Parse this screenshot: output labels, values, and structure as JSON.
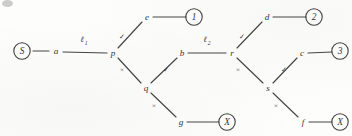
{
  "figure": {
    "stroke_color": "#2b2b2b",
    "background_color": "#fdfdfc"
  },
  "nodes": [
    {
      "id": "S",
      "label": "S",
      "x": 22,
      "y": 51,
      "shape": "circled",
      "name": "node-s"
    },
    {
      "id": "a",
      "label": "a",
      "x": 56,
      "y": 51,
      "shape": "plain",
      "name": "node-a"
    },
    {
      "id": "p",
      "label": "p",
      "x": 113,
      "y": 53,
      "shape": "plain",
      "name": "node-p"
    },
    {
      "id": "e",
      "label": "e",
      "x": 147,
      "y": 17,
      "shape": "plain",
      "name": "node-e"
    },
    {
      "id": "q",
      "label": "q",
      "x": 146,
      "y": 88,
      "shape": "plain",
      "name": "node-q"
    },
    {
      "id": "g",
      "label": "g",
      "x": 181,
      "y": 122,
      "shape": "plain",
      "name": "node-g"
    },
    {
      "id": "b",
      "label": "b",
      "x": 182,
      "y": 53,
      "shape": "plain",
      "name": "node-b"
    },
    {
      "id": "r",
      "label": "r",
      "x": 232,
      "y": 53,
      "shape": "plain",
      "name": "node-r"
    },
    {
      "id": "d",
      "label": "d",
      "x": 267,
      "y": 17,
      "shape": "plain",
      "name": "node-d"
    },
    {
      "id": "s",
      "label": "s",
      "x": 268,
      "y": 88,
      "shape": "plain",
      "name": "node-s-lower"
    },
    {
      "id": "c",
      "label": "c",
      "x": 302,
      "y": 53,
      "shape": "plain",
      "name": "node-c"
    },
    {
      "id": "f",
      "label": "f",
      "x": 303,
      "y": 122,
      "shape": "plain",
      "name": "node-f"
    },
    {
      "id": "T1",
      "label": "1",
      "x": 194,
      "y": 17,
      "shape": "circled",
      "name": "terminal-1"
    },
    {
      "id": "T2",
      "label": "2",
      "x": 314,
      "y": 17,
      "shape": "circled",
      "name": "terminal-2"
    },
    {
      "id": "T3",
      "label": "3",
      "x": 340,
      "y": 51,
      "shape": "circled",
      "name": "terminal-3"
    },
    {
      "id": "X1",
      "label": "X",
      "x": 227,
      "y": 122,
      "shape": "circled",
      "name": "terminal-x-1"
    },
    {
      "id": "X2",
      "label": "X",
      "x": 340,
      "y": 122,
      "shape": "circled",
      "name": "terminal-x-2"
    }
  ],
  "edges": [
    {
      "from": "S",
      "to": "a",
      "x1": 33,
      "y1": 51,
      "x2": 49,
      "y2": 51,
      "mark": "",
      "name": "edge-s-a"
    },
    {
      "from": "a",
      "to": "p",
      "x1": 63,
      "y1": 52,
      "x2": 107,
      "y2": 53,
      "mark": "",
      "name": "edge-a-p"
    },
    {
      "from": "p",
      "to": "e",
      "x1": 118,
      "y1": 48,
      "x2": 142,
      "y2": 22,
      "mark": "check",
      "name": "edge-p-e"
    },
    {
      "from": "e",
      "to": "T1",
      "x1": 153,
      "y1": 17,
      "x2": 186,
      "y2": 17,
      "mark": "",
      "name": "edge-e-t1"
    },
    {
      "from": "p",
      "to": "q",
      "x1": 118,
      "y1": 58,
      "x2": 141,
      "y2": 83,
      "mark": "cross",
      "name": "edge-p-q"
    },
    {
      "from": "q",
      "to": "b",
      "x1": 151,
      "y1": 83,
      "x2": 177,
      "y2": 58,
      "mark": "check",
      "name": "edge-q-b"
    },
    {
      "from": "q",
      "to": "g",
      "x1": 151,
      "y1": 93,
      "x2": 176,
      "y2": 117,
      "mark": "cross",
      "name": "edge-q-g"
    },
    {
      "from": "g",
      "to": "X1",
      "x1": 187,
      "y1": 122,
      "x2": 219,
      "y2": 122,
      "mark": "",
      "name": "edge-g-x1"
    },
    {
      "from": "b",
      "to": "r",
      "x1": 188,
      "y1": 53,
      "x2": 226,
      "y2": 53,
      "mark": "",
      "name": "edge-b-r"
    },
    {
      "from": "r",
      "to": "d",
      "x1": 237,
      "y1": 48,
      "x2": 262,
      "y2": 22,
      "mark": "check",
      "name": "edge-r-d"
    },
    {
      "from": "d",
      "to": "T2",
      "x1": 273,
      "y1": 17,
      "x2": 306,
      "y2": 17,
      "mark": "",
      "name": "edge-d-t2"
    },
    {
      "from": "r",
      "to": "s",
      "x1": 237,
      "y1": 58,
      "x2": 263,
      "y2": 83,
      "mark": "cross",
      "name": "edge-r-s"
    },
    {
      "from": "s",
      "to": "c",
      "x1": 273,
      "y1": 83,
      "x2": 297,
      "y2": 58,
      "mark": "check",
      "name": "edge-s-c"
    },
    {
      "from": "c",
      "to": "T3",
      "x1": 308,
      "y1": 53,
      "x2": 332,
      "y2": 52,
      "mark": "",
      "name": "edge-c-t3"
    },
    {
      "from": "s",
      "to": "f",
      "x1": 273,
      "y1": 93,
      "x2": 298,
      "y2": 117,
      "mark": "cross",
      "name": "edge-s-f"
    },
    {
      "from": "f",
      "to": "X2",
      "x1": 309,
      "y1": 122,
      "x2": 332,
      "y2": 122,
      "mark": "",
      "name": "edge-f-x2"
    }
  ],
  "marks": [
    {
      "symbol": "✓",
      "x": 122,
      "y": 37,
      "kind": "check",
      "name": "mark-check-p-e"
    },
    {
      "symbol": "×",
      "x": 122,
      "y": 70,
      "kind": "cross",
      "name": "mark-cross-p-q"
    },
    {
      "symbol": "✓",
      "x": 166,
      "y": 70,
      "kind": "check",
      "name": "mark-check-q-b"
    },
    {
      "symbol": "×",
      "x": 154,
      "y": 106,
      "kind": "cross",
      "name": "mark-cross-q-g"
    },
    {
      "symbol": "✓",
      "x": 242,
      "y": 37,
      "kind": "check",
      "name": "mark-check-r-d"
    },
    {
      "symbol": "×",
      "x": 238,
      "y": 70,
      "kind": "cross",
      "name": "mark-cross-r-s"
    },
    {
      "symbol": "✓",
      "x": 284,
      "y": 70,
      "kind": "check",
      "name": "mark-check-s-c"
    },
    {
      "symbol": "×",
      "x": 276,
      "y": 106,
      "kind": "cross",
      "name": "mark-cross-s-f"
    }
  ],
  "edge_labels": [
    {
      "base": "ℓ",
      "sub": "1",
      "x": 82,
      "y": 40,
      "name": "edge-label-ell-1"
    },
    {
      "base": "ℓ",
      "sub": "2",
      "x": 205,
      "y": 40,
      "name": "edge-label-ell-2"
    }
  ]
}
